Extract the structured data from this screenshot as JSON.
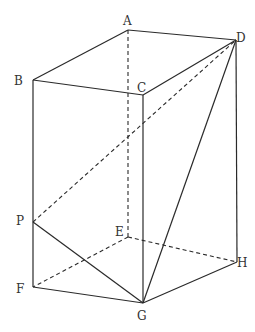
{
  "figure": {
    "type": "rectangular prism diagram",
    "vertices": {
      "A": {
        "label": "A",
        "x": 128,
        "y": 30
      },
      "B": {
        "label": "B",
        "x": 33,
        "y": 80
      },
      "C": {
        "label": "C",
        "x": 143,
        "y": 95
      },
      "D": {
        "label": "D",
        "x": 236,
        "y": 40
      },
      "E": {
        "label": "E",
        "x": 128,
        "y": 237
      },
      "F": {
        "label": "F",
        "x": 33,
        "y": 287
      },
      "G": {
        "label": "G",
        "x": 143,
        "y": 303
      },
      "H": {
        "label": "H",
        "x": 237,
        "y": 262
      },
      "P": {
        "label": "P",
        "x": 33,
        "y": 222
      }
    },
    "solid_edges": [
      [
        "A",
        "B"
      ],
      [
        "A",
        "D"
      ],
      [
        "B",
        "C"
      ],
      [
        "C",
        "D"
      ],
      [
        "B",
        "F"
      ],
      [
        "C",
        "G"
      ],
      [
        "D",
        "H"
      ],
      [
        "F",
        "G"
      ],
      [
        "G",
        "H"
      ],
      [
        "P",
        "G"
      ],
      [
        "D",
        "G"
      ]
    ],
    "dashed_edges": [
      [
        "A",
        "E"
      ],
      [
        "E",
        "F"
      ],
      [
        "E",
        "H"
      ],
      [
        "P",
        "D"
      ]
    ],
    "colors": {
      "line": "#2a2a2a",
      "label": "#333333",
      "background": "#ffffff"
    }
  }
}
